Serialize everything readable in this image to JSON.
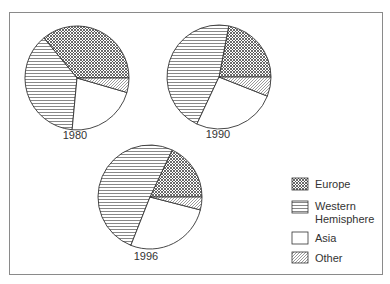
{
  "chart_data": {
    "type": "pie",
    "title": "",
    "legend": {
      "position": "right-bottom",
      "entries": [
        {
          "key": "europe",
          "label": "Europe",
          "pattern": "crosshatch-dense"
        },
        {
          "key": "western_hemisphere",
          "label_lines": [
            "Western",
            "Hemisphere"
          ],
          "label": "Western Hemisphere",
          "pattern": "horizontal-lines"
        },
        {
          "key": "asia",
          "label": "Asia",
          "pattern": "blank"
        },
        {
          "key": "other",
          "label": "Other",
          "pattern": "diagonal-lines"
        }
      ]
    },
    "categories": [
      "Europe",
      "Western Hemisphere",
      "Asia",
      "Other"
    ],
    "pies": [
      {
        "label": "1980",
        "values": [
          36,
          37.5,
          22,
          4.5
        ]
      },
      {
        "label": "1990",
        "values": [
          22,
          46,
          26,
          6
        ]
      },
      {
        "label": "1996",
        "values": [
          18,
          51,
          27,
          4
        ]
      }
    ],
    "units": "percent (estimated from slice angles)",
    "colors": {
      "stroke": "#333333",
      "frame": "#8a8a8a",
      "background": "#ffffff"
    }
  }
}
